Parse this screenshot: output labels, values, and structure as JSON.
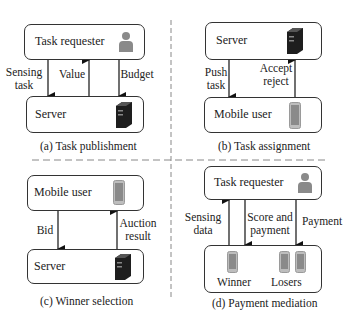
{
  "panels": {
    "a": {
      "caption": "(a) Task publishment",
      "top_box": {
        "label": "Task requester",
        "icon": "person-icon"
      },
      "bottom_box": {
        "label": "Server",
        "icon": "server-icon"
      },
      "arrows": [
        {
          "label_line1": "Sensing",
          "label_line2": "task",
          "direction": "down"
        },
        {
          "label_line1": "Value",
          "label_line2": "",
          "direction": "up"
        },
        {
          "label_line1": "Budget",
          "label_line2": "",
          "direction": "down"
        }
      ]
    },
    "b": {
      "caption": "(b) Task assignment",
      "top_box": {
        "label": "Server",
        "icon": "server-icon"
      },
      "bottom_box": {
        "label": "Mobile user",
        "icon": "phone-icon"
      },
      "arrows": [
        {
          "label_line1": "Push",
          "label_line2": "task",
          "direction": "down"
        },
        {
          "label_line1": "Accept",
          "label_line2": "reject",
          "direction": "up"
        }
      ]
    },
    "c": {
      "caption": "(c) Winner selection",
      "top_box": {
        "label": "Mobile user",
        "icon": "phone-icon"
      },
      "bottom_box": {
        "label": "Server",
        "icon": "server-icon"
      },
      "arrows": [
        {
          "label_line1": "Bid",
          "label_line2": "",
          "direction": "down"
        },
        {
          "label_line1": "Auction",
          "label_line2": "result",
          "direction": "up"
        }
      ]
    },
    "d": {
      "caption": "(d) Payment mediation",
      "top_box": {
        "label": "Task requester",
        "icon": "person-icon"
      },
      "bottom_box": {
        "winner_label": "Winner",
        "losers_label": "Losers",
        "icon": "phone-icon"
      },
      "arrows": [
        {
          "label_line1": "Sensing",
          "label_line2": "data",
          "direction": "up"
        },
        {
          "label_line1": "Score and",
          "label_line2": "payment",
          "direction": "down"
        },
        {
          "label_line1": "Payment",
          "label_line2": "",
          "direction": "down"
        }
      ]
    }
  },
  "colors": {
    "stroke": "#333333",
    "divider": "#888888",
    "icon_gray": "#8a8a8a",
    "server_dark": "#1e1e1e"
  }
}
